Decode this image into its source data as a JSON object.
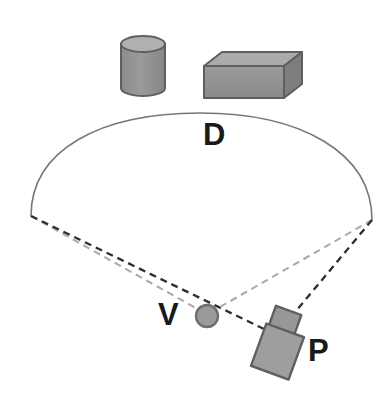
{
  "figure": {
    "background_color": "#ffffff",
    "width": 385,
    "height": 393
  },
  "labels": {
    "detection_arc": "D",
    "vehicle": "V",
    "pedestrian_vehicle": "P"
  },
  "colors": {
    "object_fill": "#919191",
    "object_fill_light": "#a9a9a9",
    "object_fill_dark": "#7c7c7c",
    "object_outline": "#5a5a5a",
    "arc_stroke": "#787878",
    "sightline_dark": "#2e2e2e",
    "sightline_light": "#ababab",
    "circle_fill": "#9a9a9a",
    "circle_outline": "#6e6e6e",
    "label_color": "#1a1a1a"
  },
  "shapes": {
    "cylinder": {
      "name": "cylinder-obstacle",
      "center_x": 143,
      "top_y": 36,
      "bottom_y": 96,
      "radius_x": 22,
      "radius_y": 8
    },
    "box": {
      "name": "box-obstacle",
      "left": 204,
      "right": 302,
      "top": 50,
      "bottom": 98,
      "depth_x": 18,
      "depth_y": 14
    },
    "arc": {
      "name": "detection-arc",
      "left_end_x": 31,
      "left_end_y": 216,
      "right_end_x": 372,
      "right_end_y": 220,
      "apex_x": 200,
      "apex_y": 114
    },
    "vehicle_circle": {
      "name": "vehicle-marker",
      "cx": 207,
      "cy": 316,
      "r": 11
    },
    "pedestrian_vehicle": {
      "name": "pedestrian-vehicle-marker",
      "cx": 282,
      "cy": 342,
      "rotation_deg": 20,
      "cab_width": 26,
      "cab_height": 22,
      "body_width": 40,
      "body_height": 46
    }
  },
  "sightlines": [
    {
      "name": "left-edge-to-vehicle",
      "style": "dashed",
      "tone": "light",
      "x1": 31,
      "y1": 216,
      "x2": 203,
      "y2": 312
    },
    {
      "name": "left-edge-to-pedestrian-vehicle",
      "style": "dashed",
      "tone": "dark",
      "x1": 31,
      "y1": 216,
      "x2": 268,
      "y2": 330
    },
    {
      "name": "right-edge-to-vehicle",
      "style": "dashed",
      "tone": "light",
      "x1": 372,
      "y1": 220,
      "x2": 214,
      "y2": 311
    },
    {
      "name": "right-edge-to-pedestrian-vehicle",
      "style": "dashed",
      "tone": "dark",
      "x1": 372,
      "y1": 220,
      "x2": 290,
      "y2": 318
    }
  ]
}
